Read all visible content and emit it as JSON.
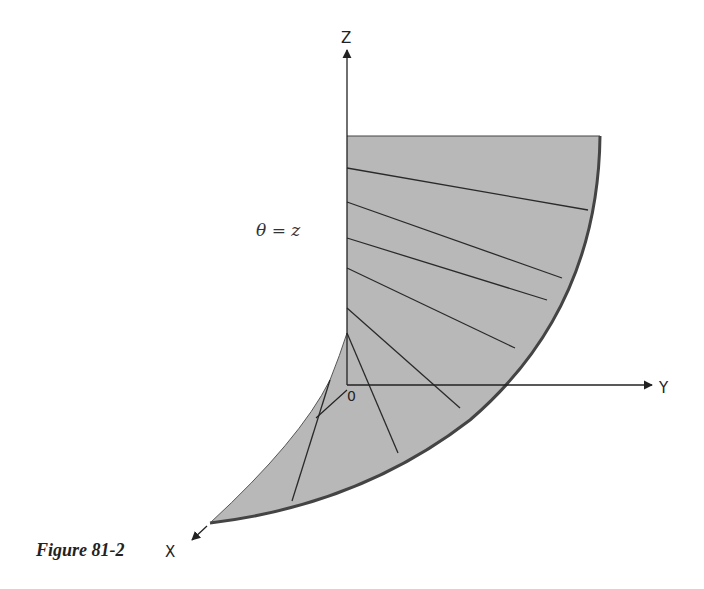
{
  "figure": {
    "caption": "Figure 81-2",
    "equation_label": "θ = z",
    "axes": {
      "z_label": "Z",
      "y_label": "Y",
      "x_label": "X",
      "origin_label": "0"
    },
    "colors": {
      "surface_fill": "#b8b8b8",
      "line": "#2a2a2a",
      "background": "#ffffff"
    }
  }
}
